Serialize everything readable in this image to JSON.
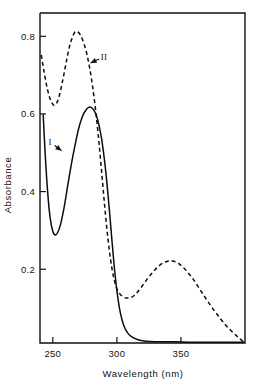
{
  "figure": {
    "kind": "uv-vis-absorption-spectrum",
    "background_color": "#ffffff",
    "ink_color": "#111111"
  },
  "axes": {
    "x": {
      "title": "Wavelength (nm)",
      "ticks": [
        "250",
        "300",
        "350"
      ],
      "tick_values": [
        250,
        300,
        350
      ],
      "range": [
        240,
        400
      ]
    },
    "y": {
      "title": "Absorbance",
      "ticks": [
        "0.2",
        "0.4",
        "0.6",
        "0.8"
      ],
      "tick_values": [
        0.2,
        0.4,
        0.6,
        0.8
      ],
      "range": [
        0.01,
        0.86
      ]
    }
  },
  "annotations": [
    {
      "id": "label-I",
      "text": "I",
      "x": 248,
      "y": 0.527,
      "points_to_x": 259,
      "points_to_y": 0.5
    },
    {
      "id": "label-II",
      "text": "II",
      "x": 290,
      "y": 0.748,
      "points_to_x": 277,
      "points_to_y": 0.727
    }
  ],
  "chart_data": {
    "type": "line",
    "title": "",
    "subtitle": "",
    "xlabel": "Wavelength (nm)",
    "ylabel": "Absorbance",
    "xlim": [
      240,
      400
    ],
    "ylim": [
      0.01,
      0.86
    ],
    "grid": false,
    "legend": "inline-annotations",
    "xticks": [
      250,
      300,
      350
    ],
    "yticks": [
      0.2,
      0.4,
      0.6,
      0.8
    ],
    "series": [
      {
        "name": "I",
        "style": "solid",
        "color": "#0d0d0d",
        "features": {
          "start_point": [
            242.5,
            0.598
          ],
          "minimum": [
            252,
            0.288
          ],
          "maximum": [
            280,
            0.617
          ],
          "baseline_from": 312,
          "baseline_value": 0.015
        },
        "x": [
          242.5,
          244,
          246,
          248,
          250,
          252,
          254,
          256,
          258,
          260,
          262,
          264,
          266,
          268,
          270,
          272,
          274,
          276,
          278,
          280,
          282,
          284,
          286,
          288,
          290,
          292,
          294,
          296,
          298,
          300,
          302,
          304,
          306,
          308,
          310,
          313,
          316,
          320,
          326,
          334,
          345,
          360,
          380,
          399
        ],
        "y": [
          0.598,
          0.5,
          0.398,
          0.33,
          0.298,
          0.288,
          0.296,
          0.315,
          0.345,
          0.382,
          0.423,
          0.462,
          0.497,
          0.53,
          0.56,
          0.583,
          0.6,
          0.611,
          0.617,
          0.617,
          0.61,
          0.596,
          0.572,
          0.537,
          0.49,
          0.43,
          0.358,
          0.28,
          0.205,
          0.145,
          0.1,
          0.07,
          0.05,
          0.038,
          0.03,
          0.023,
          0.019,
          0.016,
          0.014,
          0.013,
          0.013,
          0.012,
          0.012,
          0.012
        ]
      },
      {
        "name": "II",
        "style": "dashed",
        "color": "#0d0d0d",
        "features": {
          "start_point": [
            241,
            0.752
          ],
          "minimum_1": [
            251,
            0.622
          ],
          "maximum_1": [
            268,
            0.812
          ],
          "minimum_2": [
            310,
            0.126
          ],
          "maximum_2": [
            342,
            0.222
          ],
          "end_point": [
            399,
            0.012
          ]
        },
        "x": [
          241,
          243,
          245,
          247,
          249,
          251,
          253,
          255,
          257,
          259,
          261,
          263,
          265,
          267,
          268,
          270,
          272,
          274,
          276,
          278,
          280,
          282,
          284,
          286,
          288,
          290,
          292,
          294,
          296,
          298,
          300,
          302,
          304,
          306,
          308,
          310,
          313,
          316,
          320,
          324,
          328,
          332,
          336,
          340,
          342,
          345,
          348,
          352,
          356,
          360,
          365,
          370,
          375,
          380,
          385,
          390,
          395,
          399
        ],
        "y": [
          0.752,
          0.712,
          0.676,
          0.648,
          0.63,
          0.622,
          0.628,
          0.646,
          0.675,
          0.708,
          0.742,
          0.773,
          0.795,
          0.81,
          0.812,
          0.81,
          0.8,
          0.784,
          0.762,
          0.732,
          0.694,
          0.648,
          0.592,
          0.527,
          0.455,
          0.38,
          0.31,
          0.252,
          0.205,
          0.172,
          0.15,
          0.138,
          0.131,
          0.127,
          0.126,
          0.126,
          0.131,
          0.141,
          0.158,
          0.176,
          0.192,
          0.206,
          0.216,
          0.221,
          0.222,
          0.22,
          0.215,
          0.204,
          0.189,
          0.172,
          0.147,
          0.122,
          0.098,
          0.076,
          0.056,
          0.039,
          0.024,
          0.012
        ]
      }
    ]
  }
}
